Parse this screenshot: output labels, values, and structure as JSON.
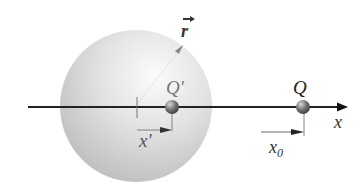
{
  "diagram": {
    "labels": {
      "image_charge": "Q'",
      "charge": "Q",
      "axis": "x",
      "charge_position": "x",
      "charge_position_subscript": "0",
      "image_position": "x'",
      "radius_vector": "r"
    },
    "elements": {
      "sphere": {
        "center_x": 136,
        "center_y": 106,
        "radius": 76,
        "color": "#d6d6d6"
      },
      "axis": {
        "start_x": 28,
        "end_x": 348,
        "y": 107
      },
      "image_charge_ball": {
        "x": 172,
        "y": 107
      },
      "charge_ball": {
        "x": 303,
        "y": 107
      },
      "origin_tick_x": 136
    },
    "colors": {
      "axis": "#222222",
      "ball": "#6e6e6e",
      "sphere_light": "#f4f4f4",
      "sphere_dark": "#bdbdbd"
    }
  }
}
